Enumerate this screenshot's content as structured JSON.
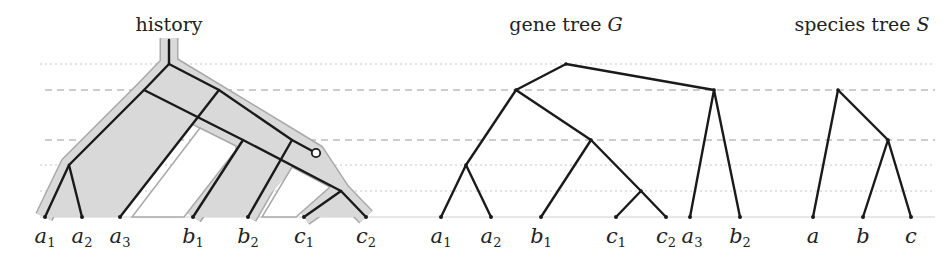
{
  "panels": {
    "history": {
      "title": "history",
      "leaves": [
        {
          "base": "a",
          "sub": "1",
          "x": 45
        },
        {
          "base": "a",
          "sub": "2",
          "x": 82
        },
        {
          "base": "a",
          "sub": "3",
          "x": 120
        },
        {
          "base": "b",
          "sub": "1",
          "x": 193
        },
        {
          "base": "b",
          "sub": "2",
          "x": 248
        },
        {
          "base": "c",
          "sub": "1",
          "x": 304
        },
        {
          "base": "c",
          "sub": "2",
          "x": 366
        }
      ],
      "loss_marker": "open-circle"
    },
    "gene_tree": {
      "title_prefix": "gene tree ",
      "title_symbol": "G",
      "leaves": [
        {
          "base": "a",
          "sub": "1",
          "x": 441
        },
        {
          "base": "a",
          "sub": "2",
          "x": 491
        },
        {
          "base": "b",
          "sub": "1",
          "x": 541
        },
        {
          "base": "c",
          "sub": "1",
          "x": 616
        },
        {
          "base": "c",
          "sub": "2",
          "x": 666
        },
        {
          "base": "a",
          "sub": "3",
          "x": 690
        },
        {
          "base": "b",
          "sub": "2",
          "x": 740
        }
      ]
    },
    "species_tree": {
      "title_prefix": "species tree ",
      "title_symbol": "S",
      "leaves": [
        {
          "base": "a",
          "sub": "",
          "x": 813
        },
        {
          "base": "b",
          "sub": "",
          "x": 863
        },
        {
          "base": "c",
          "sub": "",
          "x": 911
        }
      ]
    }
  },
  "reference_lines": [
    {
      "y": 64,
      "style": "dotted"
    },
    {
      "y": 90,
      "style": "dashed"
    },
    {
      "y": 140,
      "style": "dashed"
    },
    {
      "y": 165,
      "style": "dotted"
    },
    {
      "y": 191,
      "style": "dotted"
    },
    {
      "y": 217,
      "style": "baseline"
    }
  ]
}
